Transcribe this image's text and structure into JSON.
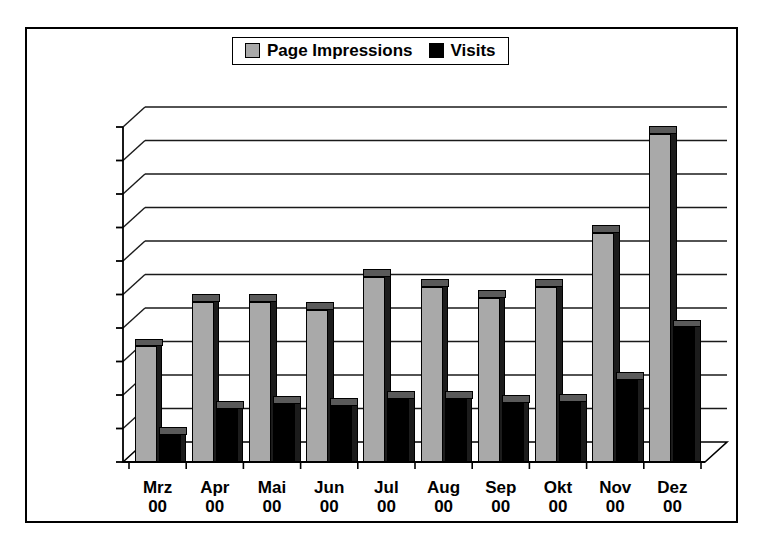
{
  "legend": {
    "position": "top-center",
    "entries": [
      {
        "label": "Page Impressions",
        "swatch": "gray-square-icon",
        "color": "#a9a9a9"
      },
      {
        "label": "Visits",
        "swatch": "black-square-icon",
        "color": "#000000"
      }
    ]
  },
  "chart_data": {
    "type": "bar",
    "title": "",
    "subtitle": "",
    "xlabel": "",
    "ylabel": "",
    "grid": true,
    "legend_position": "top-center",
    "style": "3d-column",
    "ylim": [
      0,
      10000
    ],
    "y_tick_step": 1000,
    "y_tick_labels": [
      "10.000,00",
      "9.000,00",
      "8.000,00",
      "7.000,00",
      "6.000,00",
      "5.000,00",
      "4.000,00",
      "3.000,00",
      "2.000,00",
      "1.000,00",
      "0,00"
    ],
    "y_tick_values": [
      10000,
      9000,
      8000,
      7000,
      6000,
      5000,
      4000,
      3000,
      2000,
      1000,
      0
    ],
    "categories": [
      "Mrz",
      "Apr",
      "Mai",
      "Jun",
      "Jul",
      "Aug",
      "Sep",
      "Okt",
      "Nov",
      "Dez"
    ],
    "category_sublabels": [
      "00",
      "00",
      "00",
      "00",
      "00",
      "00",
      "00",
      "00",
      "00",
      "00"
    ],
    "series": [
      {
        "name": "Page Impressions",
        "color": "#a9a9a9",
        "values": [
          3450,
          4780,
          4780,
          4550,
          5520,
          5230,
          4900,
          5230,
          6850,
          9800
        ]
      },
      {
        "name": "Visits",
        "color": "#000000",
        "values": [
          820,
          1580,
          1730,
          1680,
          1880,
          1880,
          1760,
          1800,
          2450,
          4020
        ]
      }
    ]
  }
}
